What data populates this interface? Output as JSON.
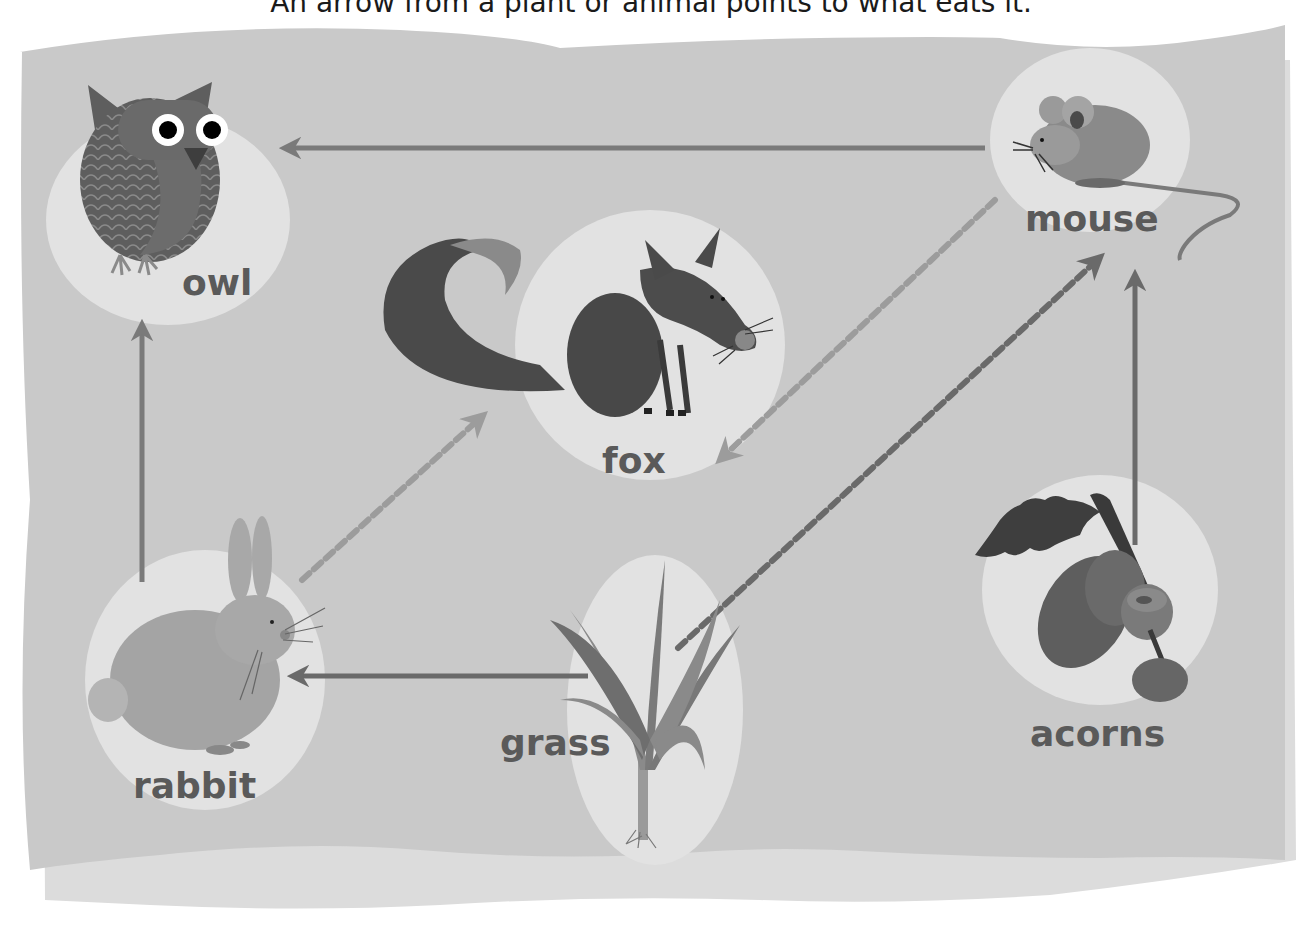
{
  "header": {
    "caption": "An arrow from a plant or animal points to what eats it."
  },
  "organisms": {
    "owl": {
      "label": "owl",
      "icon": "owl-icon"
    },
    "mouse": {
      "label": "mouse",
      "icon": "mouse-icon"
    },
    "fox": {
      "label": "fox",
      "icon": "fox-icon"
    },
    "rabbit": {
      "label": "rabbit",
      "icon": "rabbit-icon"
    },
    "grass": {
      "label": "grass",
      "icon": "grass-icon"
    },
    "acorns": {
      "label": "acorns",
      "icon": "acorns-icon"
    }
  },
  "arrows": [
    {
      "from": "mouse",
      "to": "owl",
      "style": "solid"
    },
    {
      "from": "rabbit",
      "to": "owl",
      "style": "solid"
    },
    {
      "from": "grass",
      "to": "rabbit",
      "style": "solid"
    },
    {
      "from": "acorns",
      "to": "mouse",
      "style": "solid"
    },
    {
      "from": "rabbit",
      "to": "fox",
      "style": "dashed"
    },
    {
      "from": "mouse",
      "to": "fox",
      "style": "dashed"
    },
    {
      "from": "grass",
      "to": "mouse",
      "style": "dashed"
    }
  ],
  "colors": {
    "paper": "#c9c9c9",
    "paper_back": "#dcdcdc",
    "halo": "#e4e4e4",
    "arrow_solid": "#7a7a7a",
    "arrow_dashed_light": "#9a9a9a",
    "arrow_dashed_dark": "#6e6e6e",
    "label": "#5a5a5a"
  }
}
